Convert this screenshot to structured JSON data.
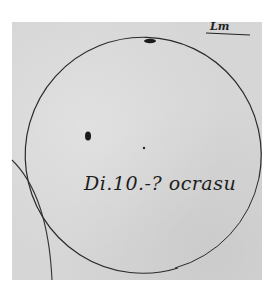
{
  "image": {
    "description": "Hand-drawn manuscript sketch of the solar disk with sunspots",
    "caption": "Di.10.-? ocrasu",
    "corner_note": "Lm",
    "colors": {
      "paper": "#d6d6d6",
      "ink": "#2a2a2a",
      "background": "#ffffff"
    },
    "features": [
      {
        "name": "main-circle",
        "cx": 142,
        "cy": 145,
        "r": 118
      },
      {
        "name": "secondary-arc",
        "description": "partial circle arc crossing lower-left"
      },
      {
        "name": "sunspot-top",
        "x": 153,
        "y": 40,
        "shape": "elongated"
      },
      {
        "name": "sunspot-left",
        "x": 88,
        "y": 136,
        "shape": "blob"
      },
      {
        "name": "sunspot-center",
        "x": 144,
        "y": 148,
        "shape": "dot"
      }
    ]
  }
}
